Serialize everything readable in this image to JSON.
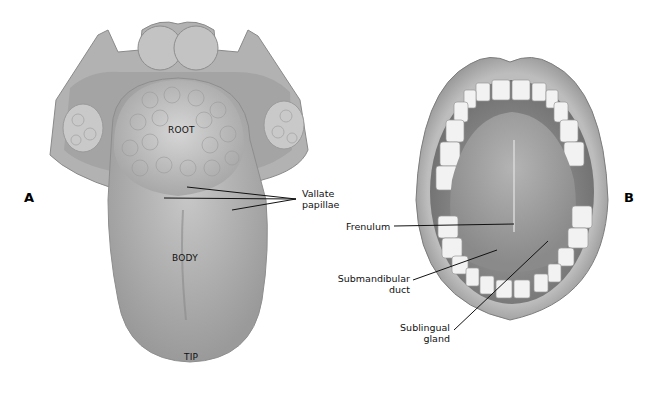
{
  "figure": {
    "panels": [
      {
        "id": "A",
        "label": "A",
        "subject": "Dorsal surface of tongue",
        "region_labels": {
          "root": "ROOT",
          "body": "BODY",
          "tip": "TIP"
        },
        "callouts": [
          {
            "line1": "Vallate",
            "line2": "papillae"
          }
        ]
      },
      {
        "id": "B",
        "label": "B",
        "subject": "Open mouth, underside of tongue",
        "callouts": [
          {
            "line1": "Frenulum"
          },
          {
            "line1": "Submandibular",
            "line2": "duct"
          },
          {
            "line1": "Sublingual",
            "line2": "gland"
          }
        ]
      }
    ],
    "colors": {
      "background": "#ffffff",
      "tissue_light": "#c9c9c9",
      "tissue_mid": "#a9a9a9",
      "tissue_dark": "#7a7a7a",
      "text": "#111111"
    }
  }
}
